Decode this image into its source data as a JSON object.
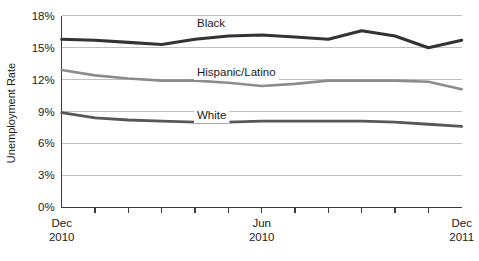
{
  "chart_data": {
    "type": "line",
    "title": "",
    "xlabel": "",
    "ylabel": "Unemployment Rate",
    "ylim": [
      0,
      18
    ],
    "ytick_labels": [
      "18%",
      "15%",
      "12%",
      "9%",
      "6%",
      "3%",
      "0%"
    ],
    "ytick_values": [
      18,
      15,
      12,
      9,
      6,
      3,
      0
    ],
    "grid": true,
    "legend_position": "inline-labels",
    "x_axis_ticks": 13,
    "x_tick_labels": [
      {
        "line1": "Dec",
        "line2": "2010",
        "index": 0
      },
      {
        "line1": "Jun",
        "line2": "2010",
        "index": 6
      },
      {
        "line1": "Dec",
        "line2": "2011",
        "index": 12
      }
    ],
    "x": [
      0,
      1,
      2,
      3,
      4,
      5,
      6,
      7,
      8,
      9,
      10,
      11,
      12
    ],
    "series": [
      {
        "name": "Black",
        "color": "#333333",
        "width": 3.1,
        "label_x": 197,
        "label_y": 27,
        "values": [
          15.8,
          15.7,
          15.5,
          15.3,
          15.8,
          16.1,
          16.2,
          16.0,
          15.8,
          16.6,
          16.1,
          15.0,
          15.7
        ]
      },
      {
        "name": "Hispanic/Latino",
        "color": "#8c8c8c",
        "width": 2.6,
        "label_x": 197,
        "label_y": 76,
        "values": [
          12.9,
          12.4,
          12.1,
          11.9,
          11.9,
          11.7,
          11.4,
          11.6,
          11.9,
          11.9,
          11.9,
          11.8,
          11.1
        ]
      },
      {
        "name": "White",
        "color": "#575757",
        "width": 2.8,
        "label_x": 197,
        "label_y": 119,
        "values": [
          8.9,
          8.4,
          8.2,
          8.1,
          8.0,
          8.0,
          8.1,
          8.1,
          8.1,
          8.1,
          8.0,
          7.8,
          7.6
        ]
      }
    ]
  },
  "axis": {
    "y_title": "Unemployment Rate"
  }
}
